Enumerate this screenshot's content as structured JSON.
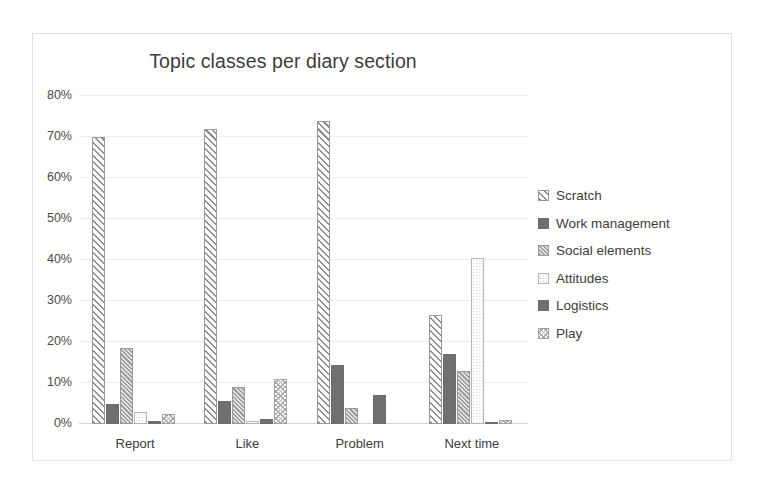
{
  "chart_data": {
    "type": "bar",
    "title": "Topic classes per diary section",
    "xlabel": "",
    "ylabel": "",
    "ylim": [
      0,
      80
    ],
    "ytick_labels": [
      "0%",
      "10%",
      "20%",
      "30%",
      "40%",
      "50%",
      "60%",
      "70%",
      "80%"
    ],
    "ytick_values": [
      0,
      10,
      20,
      30,
      40,
      50,
      60,
      70,
      80
    ],
    "grid": true,
    "legend_position": "right",
    "categories": [
      "Report",
      "Like",
      "Problem",
      "Next time"
    ],
    "series": [
      {
        "name": "Scratch",
        "pattern": "diagonal-stripes",
        "values": [
          70.0,
          72.0,
          74.0,
          26.5
        ]
      },
      {
        "name": "Work management",
        "pattern": "solid-dark-gray",
        "values": [
          5.0,
          5.5,
          14.5,
          17.0
        ]
      },
      {
        "name": "Social elements",
        "pattern": "dense-diagonal",
        "values": [
          18.5,
          9.0,
          4.0,
          13.0
        ]
      },
      {
        "name": "Attitudes",
        "pattern": "light-dotted",
        "values": [
          3.0,
          0.7,
          0.0,
          40.5
        ]
      },
      {
        "name": "Logistics",
        "pattern": "solid-dark-gray",
        "values": [
          0.7,
          1.2,
          7.0,
          0.4
        ]
      },
      {
        "name": "Play",
        "pattern": "light-crosshatch",
        "values": [
          2.5,
          11.0,
          0.0,
          1.0
        ]
      }
    ]
  },
  "legend": {
    "items": [
      {
        "label": "Scratch"
      },
      {
        "label": "Work management"
      },
      {
        "label": "Social elements"
      },
      {
        "label": "Attitudes"
      },
      {
        "label": "Logistics"
      },
      {
        "label": "Play"
      }
    ]
  },
  "colors": {
    "frame_border": "#e2e2e2",
    "gridline": "#ededed",
    "axis_line": "#d5d5d5",
    "text": "#3d3d3d",
    "bar_dark": "#6f6f6f",
    "bar_outline": "#9a9a9a",
    "background": "#ffffff"
  }
}
